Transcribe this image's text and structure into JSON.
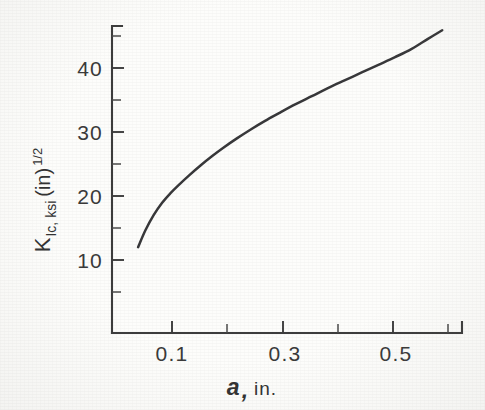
{
  "figure": {
    "background_color": "#fdfdfb",
    "ink_color": "#3a3a3a",
    "curve_color": "#38383a"
  },
  "axes": {
    "x_title_symbol": "a",
    "x_title_separator": ",",
    "x_title_unit": "in.",
    "y_title_symbol": "K",
    "y_title_subscript": "Ic, ksi",
    "y_title_paren": "(in)",
    "y_title_exponent": "1/2",
    "x_tick_labels": [
      "0.1",
      "0.3",
      "0.5"
    ],
    "y_tick_labels": [
      "10",
      "20",
      "30",
      "40"
    ]
  },
  "chart_data": {
    "type": "line",
    "title": "",
    "subtitle": "",
    "xlabel": "a, in.",
    "ylabel": "K_Ic, ksi (in)^1/2",
    "xlim": [
      0.0,
      0.63
    ],
    "ylim": [
      0,
      48
    ],
    "grid": false,
    "legend": null,
    "x_major_ticks": [
      0.1,
      0.3,
      0.5
    ],
    "x_minor_ticks": [
      0.2,
      0.4,
      0.6
    ],
    "y_major_ticks": [
      10,
      20,
      30,
      40
    ],
    "y_minor_ticks": [
      5,
      15,
      25,
      35,
      45
    ],
    "annotations": [],
    "series": [
      {
        "name": "Fracture toughness vs crack length",
        "x": [
          0.047,
          0.06,
          0.075,
          0.09,
          0.105,
          0.12,
          0.14,
          0.16,
          0.18,
          0.2,
          0.225,
          0.25,
          0.275,
          0.3,
          0.33,
          0.36,
          0.39,
          0.42,
          0.45,
          0.48,
          0.51,
          0.54,
          0.57,
          0.595
        ],
        "y": [
          12.0,
          14.6,
          17.0,
          18.9,
          20.4,
          21.7,
          23.3,
          24.8,
          26.2,
          27.5,
          29.0,
          30.4,
          31.7,
          32.9,
          34.3,
          35.6,
          36.9,
          38.1,
          39.3,
          40.5,
          41.7,
          43.0,
          44.6,
          45.9
        ]
      }
    ]
  },
  "geometry": {
    "x_axis_y_px": 333,
    "y_axis_x_px": 112,
    "x_origin_value": 0.0,
    "px_per_x_unit": 555,
    "y_value_10_px": 260,
    "px_per_y_unit": 6.4
  }
}
